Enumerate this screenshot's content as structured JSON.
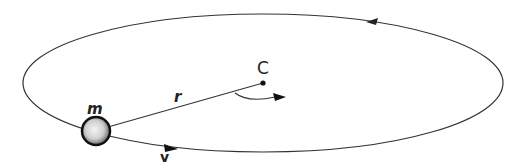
{
  "diagram": {
    "labels": {
      "center": "C",
      "mass": "m",
      "radius": "r",
      "velocity": "v"
    },
    "colors": {
      "line": "#333333",
      "background": "#ffffff"
    }
  }
}
